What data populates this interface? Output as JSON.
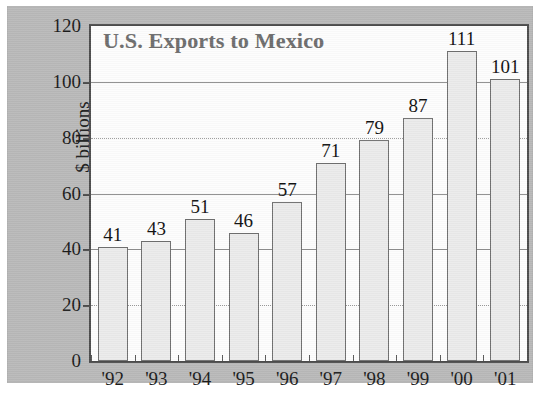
{
  "figure": {
    "panel_background": "#b9b9b9",
    "plot_background": "#fdfdfd",
    "title_color": "#6d6d6d",
    "bar_fill": "#ebebeb",
    "bar_stroke": "#6f6f6f",
    "axis_color": "#4c4c4c"
  },
  "chart_data": {
    "type": "bar",
    "title": "U.S. Exports to Mexico",
    "subtitle": "",
    "xlabel": "",
    "ylabel": "$ billions",
    "categories": [
      "'92",
      "'93",
      "'94",
      "'95",
      "'96",
      "'97",
      "'98",
      "'99",
      "'00",
      "'01"
    ],
    "values": [
      41,
      43,
      51,
      46,
      57,
      71,
      79,
      87,
      111,
      101
    ],
    "data_labels": [
      "41",
      "43",
      "51",
      "46",
      "57",
      "71",
      "79",
      "87",
      "111",
      "101"
    ],
    "ylim": [
      0,
      120
    ],
    "ytick_labels": [
      "0",
      "20",
      "40",
      "60",
      "80",
      "100",
      "120"
    ],
    "ytick_values": [
      0,
      20,
      40,
      60,
      80,
      100,
      120
    ],
    "grid": true,
    "grid_axis": "y",
    "legend": null,
    "legend_position": "none"
  }
}
